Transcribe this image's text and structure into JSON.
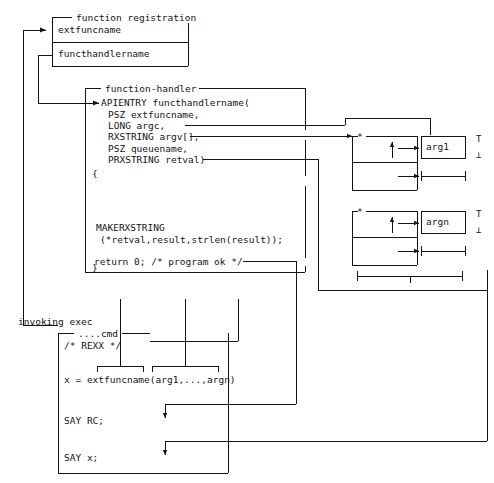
{
  "diagram": {
    "title_semantic": "rexx-external-function-flow",
    "colors": {
      "ink": "#141414",
      "paper": "#ffffff"
    },
    "registration": {
      "caption": "function registration",
      "row1": "extfuncname",
      "row2": "functhandlername"
    },
    "handler": {
      "caption": "function-handler",
      "code": [
        "APIENTRY functhandlername(",
        "  PSZ extfuncname,",
        "  LONG argc,",
        "  RXSTRING argv[],",
        "  PSZ queuename,",
        "  PRXSTRING retval)",
        "{",
        "",
        "",
        " MAKERXSTRING",
        "  (*retval,result,strlen(result));",
        " return 0; /* program ok */",
        "}"
      ],
      "line_apientry": "APIENTRY functhandlername(",
      "line_psz_ext": "PSZ extfuncname,",
      "line_long_argc": "LONG argc,",
      "line_rxstring_argv": "RXSTRING argv[],",
      "line_psz_queue": "PSZ queuename,",
      "line_prxstring_retval": "PRXSTRING retval)",
      "line_open_brace": "{",
      "line_makerxstring": "MAKERXSTRING",
      "line_makerxstring_args": "(*retval,result,strlen(result));",
      "line_return": "return 0; /* program ok */",
      "line_close_brace": "}"
    },
    "args": [
      {
        "name": "arg1",
        "star": "*",
        "top_mark": "T",
        "bottom_mark": "⊥"
      },
      {
        "name": "argn",
        "star": "*",
        "top_mark": "T",
        "bottom_mark": "⊥"
      }
    ],
    "exec": {
      "caption": "invoking exec",
      "file_label": "....cmd",
      "line_comment": "/* REXX */",
      "line_call": "x = extfuncname(arg1,...,argn)",
      "line_say_rc": "SAY RC;",
      "line_say_x": "SAY x;"
    }
  }
}
